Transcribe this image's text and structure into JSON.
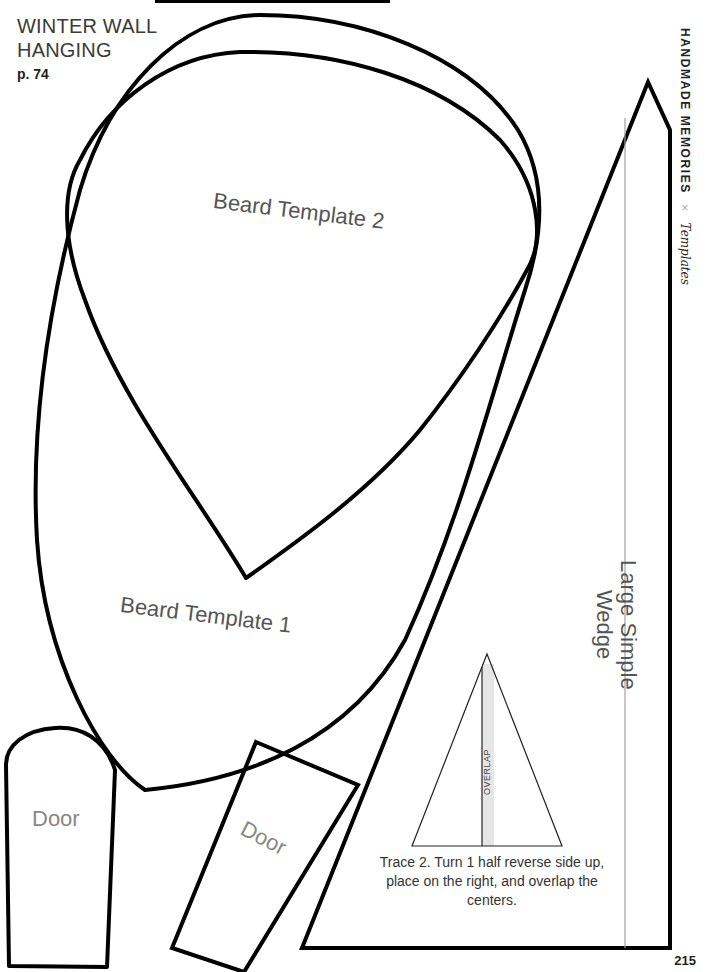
{
  "header": {
    "title_line1": "WINTER WALL",
    "title_line2": "HANGING",
    "page_ref": "p. 74"
  },
  "running_head": {
    "brand": "HANDMADE MEMORIES",
    "separator": "×",
    "section": "Templates"
  },
  "templates": {
    "beard_2": "Beard Template 2",
    "beard_1": "Beard Template 1",
    "door_1": "Door",
    "door_2": "Door",
    "wedge_line1": "Large Simple",
    "wedge_line2": "Wedge",
    "overlap": "OVERLAP"
  },
  "instructions": "Trace 2. Turn 1 half reverse side up, place on the right, and overlap the centers.",
  "folio": "215",
  "colors": {
    "outline": "#000000",
    "label_text": "#555555",
    "overlap_fill": "#e6e6e6",
    "guide_line": "#a0a0a0"
  }
}
